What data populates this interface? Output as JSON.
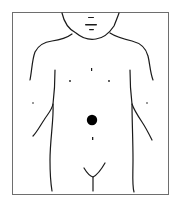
{
  "diagram": {
    "marker": {
      "label": "location marker",
      "shape": "filled circle",
      "color": "#000000",
      "position": "upper abdomen, above navel"
    },
    "colors": {
      "line": "#1a1a1a",
      "frame": "#6e6e6e",
      "background": "#ffffff"
    }
  }
}
